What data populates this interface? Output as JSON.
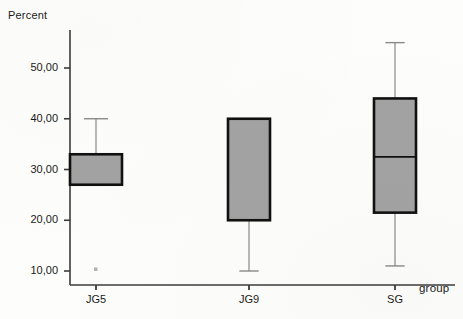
{
  "chart_data": {
    "type": "box",
    "title": "",
    "xlabel": "group",
    "ylabel": "Percent",
    "categories": [
      "JG5",
      "JG9",
      "SG"
    ],
    "ylim": [
      5,
      58
    ],
    "yticks": [
      10,
      20,
      30,
      40,
      50
    ],
    "ytick_labels": [
      "10,00",
      "20,00",
      "30,00",
      "40,00",
      "50,00"
    ],
    "grid": false,
    "legend": false,
    "box_fill_color": "#a3a3a3",
    "box_edge_color": "#111111",
    "whisker_color": "#8a8a8a",
    "axis_color": "#3b3b3b",
    "boxes": [
      {
        "category": "JG5",
        "q1": 27.0,
        "median": null,
        "q3": 33.0,
        "whisker_low": 27.0,
        "whisker_high": 40.0,
        "outliers": [
          10.3
        ]
      },
      {
        "category": "JG9",
        "q1": 20.0,
        "median": null,
        "q3": 40.0,
        "whisker_low": 10.0,
        "whisker_high": 40.0,
        "outliers": []
      },
      {
        "category": "SG",
        "q1": 21.5,
        "median": 32.5,
        "q3": 44.0,
        "whisker_low": 11.0,
        "whisker_high": 55.0,
        "outliers": []
      }
    ]
  }
}
